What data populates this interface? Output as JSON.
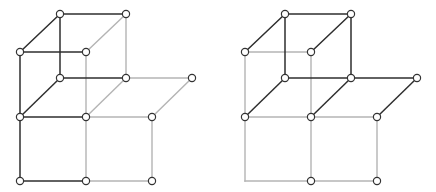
{
  "colors": {
    "background": "#ffffff",
    "edge_dark": "#2e2e2e",
    "edge_light": "#b4b4b4",
    "node_fill": "#ffffff",
    "node_stroke": "#333333"
  },
  "node_radius": 3.6,
  "graphs": [
    {
      "name": "left-graph",
      "nodes": {
        "A": [
          60,
          14
        ],
        "B": [
          126,
          14
        ],
        "C": [
          20,
          52
        ],
        "D": [
          86,
          52
        ],
        "E": [
          60,
          78
        ],
        "F": [
          126,
          78
        ],
        "G": [
          192,
          78
        ],
        "H": [
          20,
          117
        ],
        "I": [
          86,
          117
        ],
        "J": [
          152,
          117
        ],
        "K": [
          20,
          181
        ],
        "L": [
          86,
          181
        ],
        "M": [
          152,
          181
        ]
      },
      "dark_edges": [
        [
          "A",
          "B"
        ],
        [
          "A",
          "C"
        ],
        [
          "A",
          "E"
        ],
        [
          "C",
          "D"
        ],
        [
          "C",
          "H"
        ],
        [
          "E",
          "F"
        ],
        [
          "E",
          "H"
        ],
        [
          "H",
          "I"
        ],
        [
          "H",
          "K"
        ],
        [
          "K",
          "L"
        ]
      ],
      "light_edges": [
        [
          "B",
          "D"
        ],
        [
          "B",
          "F"
        ],
        [
          "D",
          "I"
        ],
        [
          "F",
          "I"
        ],
        [
          "F",
          "G"
        ],
        [
          "G",
          "J"
        ],
        [
          "I",
          "J"
        ],
        [
          "I",
          "L"
        ],
        [
          "J",
          "M"
        ],
        [
          "L",
          "M"
        ]
      ],
      "hidden_nodes": []
    },
    {
      "name": "right-graph",
      "nodes": {
        "A": [
          285,
          14
        ],
        "B": [
          351,
          14
        ],
        "C": [
          245,
          52
        ],
        "D": [
          311,
          52
        ],
        "E": [
          285,
          78
        ],
        "F": [
          351,
          78
        ],
        "G": [
          417,
          78
        ],
        "H": [
          245,
          117
        ],
        "I": [
          311,
          117
        ],
        "J": [
          377,
          117
        ],
        "K": [
          245,
          181
        ],
        "L": [
          311,
          181
        ],
        "M": [
          377,
          181
        ]
      },
      "dark_edges": [
        [
          "A",
          "B"
        ],
        [
          "A",
          "C"
        ],
        [
          "A",
          "E"
        ],
        [
          "B",
          "D"
        ],
        [
          "B",
          "F"
        ],
        [
          "E",
          "F"
        ],
        [
          "F",
          "G"
        ],
        [
          "E",
          "H"
        ],
        [
          "F",
          "I"
        ],
        [
          "G",
          "J"
        ]
      ],
      "light_edges": [
        [
          "C",
          "D"
        ],
        [
          "C",
          "H"
        ],
        [
          "D",
          "I"
        ],
        [
          "H",
          "I"
        ],
        [
          "I",
          "J"
        ],
        [
          "H",
          "K"
        ],
        [
          "K",
          "L"
        ],
        [
          "I",
          "L"
        ],
        [
          "L",
          "M"
        ],
        [
          "J",
          "M"
        ]
      ],
      "hidden_nodes": [
        "K"
      ]
    }
  ]
}
